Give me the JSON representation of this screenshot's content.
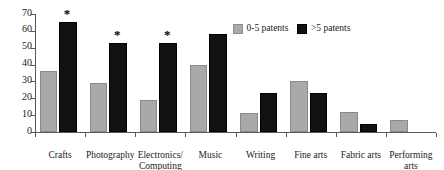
{
  "chart_data": {
    "type": "bar",
    "title": "",
    "subtitle": "",
    "xlabel": "",
    "ylabel": "",
    "ylim": [
      0,
      70
    ],
    "yticks": [
      0,
      10,
      20,
      30,
      40,
      50,
      60,
      70
    ],
    "grid": false,
    "legend_position": "top-right",
    "categories": [
      "Crafts",
      "Photography",
      "Electronics/\nComputing",
      "Music",
      "Writing",
      "Fine arts",
      "Fabric arts",
      "Performing\narts"
    ],
    "series": [
      {
        "name": "0-5 patents",
        "color": "#a9a9a9",
        "values": [
          36,
          29,
          19,
          40,
          11,
          30,
          12,
          7
        ]
      },
      {
        "name": ">5 patents",
        "color": "#111111",
        "values": [
          65,
          53,
          53,
          58,
          23,
          23,
          5,
          null
        ]
      }
    ],
    "annotations": [
      {
        "text": "*",
        "category": "Crafts",
        "series": ">5 patents"
      },
      {
        "text": "*",
        "category": "Photography",
        "series": ">5 patents"
      },
      {
        "text": "*",
        "category": "Electronics/\nComputing",
        "series": ">5 patents"
      }
    ]
  },
  "legend": {
    "entries": [
      {
        "label": "0-5 patents",
        "swatch": "gray-square-icon"
      },
      {
        "label": ">5 patents",
        "swatch": "black-square-icon"
      }
    ]
  }
}
